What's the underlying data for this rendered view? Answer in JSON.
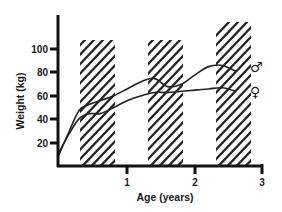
{
  "chart_data": {
    "type": "line",
    "title": "",
    "xlabel": "Age (years)",
    "ylabel": "Weight (kg)",
    "xlim": [
      0,
      3
    ],
    "ylim": [
      0,
      120
    ],
    "x_ticks": [
      "1",
      "2",
      "3"
    ],
    "y_ticks": [
      "20",
      "40",
      "60",
      "80",
      "100"
    ],
    "grid": false,
    "legend": "inline labels at right end of curves",
    "shaded_regions": [
      {
        "x_start": 0.31,
        "x_end": 0.82,
        "pattern": "diagonal hatch"
      },
      {
        "x_start": 1.31,
        "x_end": 1.82,
        "pattern": "diagonal hatch"
      },
      {
        "x_start": 2.31,
        "x_end": 2.82,
        "pattern": "diagonal hatch"
      }
    ],
    "series": [
      {
        "name": "♂",
        "label": "male",
        "x": [
          0.0,
          0.15,
          0.3,
          0.45,
          0.6,
          0.8,
          1.0,
          1.2,
          1.4,
          1.6,
          1.8,
          2.0,
          2.2,
          2.4,
          2.6
        ],
        "values": [
          10,
          30,
          48,
          53,
          56,
          60,
          66,
          72,
          75,
          68,
          70,
          78,
          85,
          86,
          81
        ]
      },
      {
        "name": "♀",
        "label": "female",
        "x": [
          0.0,
          0.15,
          0.3,
          0.45,
          0.6,
          0.8,
          1.0,
          1.2,
          1.4,
          1.6,
          1.8,
          2.0,
          2.2,
          2.4,
          2.6
        ],
        "values": [
          12,
          28,
          41,
          45,
          45,
          50,
          56,
          60,
          63,
          63,
          64,
          65,
          66,
          67,
          64
        ]
      }
    ]
  },
  "labels": {
    "x_axis_title": "Age (years)",
    "y_axis_title": "Weight (kg)",
    "male_symbol": "♂",
    "female_symbol": "♀",
    "y_ticks": [
      "20",
      "40",
      "60",
      "80",
      "100"
    ],
    "x_ticks": [
      "1",
      "2",
      "3"
    ]
  }
}
